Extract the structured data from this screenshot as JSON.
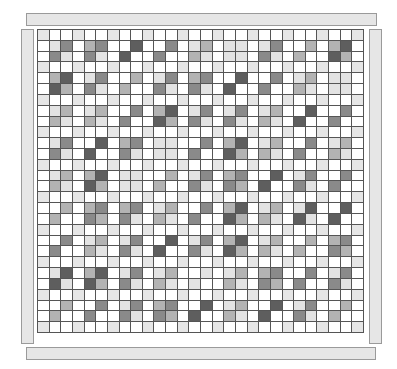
{
  "board": {
    "periods": 9,
    "shade_colors": {
      "0": "#ffffff",
      "1": "#e3e3e3",
      "2": "#b3b3b3",
      "3": "#8a8a8a",
      "4": "#5e5e5e"
    },
    "spacer_color": "#e6e6e6",
    "blocks": [
      [
        [
          1,
          3,
          3,
          1
        ],
        [
          2,
          3,
          3,
          1
        ],
        [
          0,
          4,
          4,
          0
        ],
        [
          0,
          3,
          3,
          0
        ],
        [
          1,
          2,
          2,
          1
        ],
        [
          1,
          1,
          1,
          1
        ],
        [
          1,
          3,
          3,
          1
        ],
        [
          0,
          2,
          2,
          0
        ],
        [
          2,
          4,
          4,
          2
        ]
      ],
      [
        [
          2,
          4,
          4,
          2
        ],
        [
          1,
          3,
          3,
          1
        ],
        [
          0,
          2,
          2,
          0
        ],
        [
          1,
          3,
          3,
          1
        ],
        [
          2,
          3,
          3,
          1
        ],
        [
          0,
          4,
          4,
          0
        ],
        [
          0,
          3,
          3,
          0
        ],
        [
          1,
          2,
          2,
          1
        ],
        [
          1,
          1,
          1,
          1
        ]
      ],
      [
        [
          1,
          2,
          2,
          1
        ],
        [
          1,
          2,
          2,
          1
        ],
        [
          0,
          3,
          3,
          0
        ],
        [
          2,
          4,
          4,
          2
        ],
        [
          1,
          3,
          3,
          1
        ],
        [
          1,
          3,
          3,
          1
        ],
        [
          1,
          2,
          2,
          1
        ],
        [
          0,
          4,
          4,
          0
        ],
        [
          0,
          3,
          3,
          0
        ]
      ],
      [
        [
          1,
          3,
          3,
          1
        ],
        [
          0,
          4,
          4,
          0
        ],
        [
          2,
          3,
          3,
          1
        ],
        [
          1,
          1,
          1,
          1
        ],
        [
          0,
          3,
          3,
          0
        ],
        [
          2,
          4,
          4,
          2
        ],
        [
          1,
          2,
          2,
          1
        ],
        [
          0,
          3,
          3,
          0
        ],
        [
          1,
          2,
          2,
          1
        ]
      ],
      [
        [
          1,
          2,
          2,
          1
        ],
        [
          2,
          4,
          4,
          2
        ],
        [
          1,
          1,
          1,
          1
        ],
        [
          0,
          2,
          2,
          0
        ],
        [
          1,
          3,
          3,
          1
        ],
        [
          2,
          3,
          3,
          2
        ],
        [
          0,
          4,
          4,
          0
        ],
        [
          1,
          3,
          3,
          1
        ],
        [
          0,
          3,
          3,
          0
        ]
      ],
      [
        [
          0,
          2,
          2,
          0
        ],
        [
          2,
          3,
          3,
          2
        ],
        [
          2,
          3,
          3,
          1
        ],
        [
          1,
          2,
          2,
          1
        ],
        [
          0,
          3,
          3,
          0
        ],
        [
          2,
          4,
          4,
          2
        ],
        [
          1,
          2,
          2,
          1
        ],
        [
          1,
          4,
          4,
          1
        ],
        [
          0,
          4,
          4,
          0
        ]
      ],
      [
        [
          0,
          3,
          3,
          0
        ],
        [
          1,
          2,
          2,
          1
        ],
        [
          1,
          3,
          3,
          1
        ],
        [
          0,
          4,
          4,
          0
        ],
        [
          1,
          3,
          3,
          1
        ],
        [
          2,
          4,
          4,
          2
        ],
        [
          1,
          2,
          2,
          1
        ],
        [
          0,
          2,
          2,
          0
        ],
        [
          2,
          3,
          3,
          2
        ]
      ],
      [
        [
          1,
          4,
          4,
          1
        ],
        [
          2,
          4,
          4,
          2
        ],
        [
          1,
          3,
          3,
          1
        ],
        [
          1,
          2,
          2,
          1
        ],
        [
          0,
          1,
          1,
          0
        ],
        [
          1,
          2,
          2,
          1
        ],
        [
          2,
          3,
          3,
          2
        ],
        [
          0,
          3,
          3,
          0
        ],
        [
          1,
          3,
          3,
          1
        ]
      ],
      [
        [
          0,
          2,
          2,
          0
        ],
        [
          0,
          3,
          3,
          0
        ],
        [
          1,
          3,
          3,
          1
        ],
        [
          2,
          3,
          3,
          2
        ],
        [
          0,
          4,
          4,
          0
        ],
        [
          1,
          2,
          2,
          1
        ],
        [
          0,
          4,
          4,
          0
        ],
        [
          1,
          3,
          3,
          1
        ],
        [
          0,
          2,
          2,
          0
        ]
      ]
    ]
  },
  "frame": {
    "top_bar": "horizontal-bar",
    "bottom_bar": "horizontal-bar",
    "left_bar": "vertical-bar",
    "right_bar": "vertical-bar"
  }
}
